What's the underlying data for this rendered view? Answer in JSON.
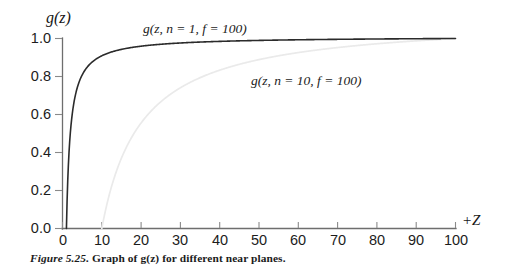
{
  "figure": {
    "caption_label": "Figure 5.25.",
    "caption_text_pre": " Graph of ",
    "caption_math": "g(z)",
    "caption_text_post": " for different near planes."
  },
  "chart_data": {
    "type": "line",
    "title": "",
    "xlabel": "+Z",
    "ylabel": "g(z)",
    "xlim": [
      0,
      100
    ],
    "ylim": [
      0.0,
      1.0
    ],
    "grid": false,
    "legend": "inline-annotations",
    "x_ticks": [
      "0",
      "10",
      "20",
      "30",
      "40",
      "50",
      "60",
      "70",
      "80",
      "90",
      "100"
    ],
    "x_tick_values": [
      0,
      10,
      20,
      30,
      40,
      50,
      60,
      70,
      80,
      90,
      100
    ],
    "y_ticks": [
      "0.0",
      "0.2",
      "0.4",
      "0.6",
      "0.8",
      "1.0"
    ],
    "y_tick_values": [
      0.0,
      0.2,
      0.4,
      0.6,
      0.8,
      1.0
    ],
    "formula": "g(z) = (f / (f - n)) * (1 - n / z)",
    "series": [
      {
        "name": "g(z, n = 1, f = 100)",
        "label": "g(z, n = 1, f = 100)",
        "color": "#2b2b2b",
        "n": 1,
        "f": 100,
        "x": [
          1,
          1.5,
          2,
          2.5,
          3,
          4,
          5,
          6,
          7,
          8,
          9,
          10,
          12,
          14,
          16,
          18,
          20,
          25,
          30,
          35,
          40,
          50,
          60,
          70,
          80,
          90,
          100
        ],
        "values": [
          0.0,
          0.337,
          0.505,
          0.606,
          0.673,
          0.758,
          0.808,
          0.842,
          0.866,
          0.884,
          0.899,
          0.909,
          0.926,
          0.938,
          0.947,
          0.954,
          0.96,
          0.97,
          0.976,
          0.981,
          0.985,
          0.99,
          0.993,
          0.996,
          0.998,
          0.999,
          1.0
        ]
      },
      {
        "name": "g(z, n = 10, f = 100)",
        "label": "g(z, n = 10, f = 100)",
        "color": "#eaeaea",
        "n": 10,
        "f": 100,
        "x": [
          10,
          11,
          12,
          14,
          16,
          18,
          20,
          25,
          30,
          35,
          40,
          45,
          50,
          60,
          70,
          80,
          90,
          100
        ],
        "values": [
          0.0,
          0.101,
          0.185,
          0.317,
          0.417,
          0.494,
          0.556,
          0.667,
          0.741,
          0.794,
          0.833,
          0.864,
          0.889,
          0.926,
          0.952,
          0.972,
          0.988,
          1.0
        ]
      }
    ],
    "annotations": [
      {
        "text": "g(z, n = 1, f = 100)",
        "x_px": 143,
        "y_px": 33
      },
      {
        "text": "g(z, n = 10, f = 100)",
        "x_px": 251,
        "y_px": 85
      }
    ]
  }
}
